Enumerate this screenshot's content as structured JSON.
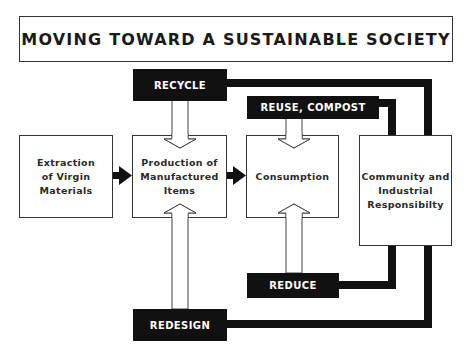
{
  "title": "MOVING TOWARD A SUSTAINABLE SOCIETY",
  "nodes": {
    "extraction": "Extraction\nof Virgin\nMaterials",
    "production": "Production of\nManufactured\nItems",
    "consumption": "Consumption",
    "community": "Community and\nIndustrial\nResponsibilty"
  },
  "actions": {
    "recycle": "RECYCLE",
    "reuse_compost": "REUSE, COMPOST",
    "reduce": "REDUCE",
    "redesign": "REDESIGN"
  },
  "flows": [
    {
      "from": "extraction",
      "to": "production",
      "type": "solid-arrow"
    },
    {
      "from": "production",
      "to": "consumption",
      "type": "solid-arrow"
    },
    {
      "from": "recycle",
      "to": "production",
      "type": "hollow-arrow"
    },
    {
      "from": "redesign",
      "to": "production",
      "type": "hollow-arrow"
    },
    {
      "from": "reuse_compost",
      "to": "consumption",
      "type": "hollow-arrow"
    },
    {
      "from": "reduce",
      "to": "consumption",
      "type": "hollow-arrow"
    },
    {
      "from": "community",
      "to": "recycle",
      "type": "thick-line"
    },
    {
      "from": "community",
      "to": "reuse_compost",
      "type": "thick-line"
    },
    {
      "from": "community",
      "to": "reduce",
      "type": "thick-line"
    },
    {
      "from": "community",
      "to": "redesign",
      "type": "thick-line"
    }
  ],
  "colors": {
    "ink": "#111111",
    "border": "#333333",
    "background": "#ffffff"
  }
}
